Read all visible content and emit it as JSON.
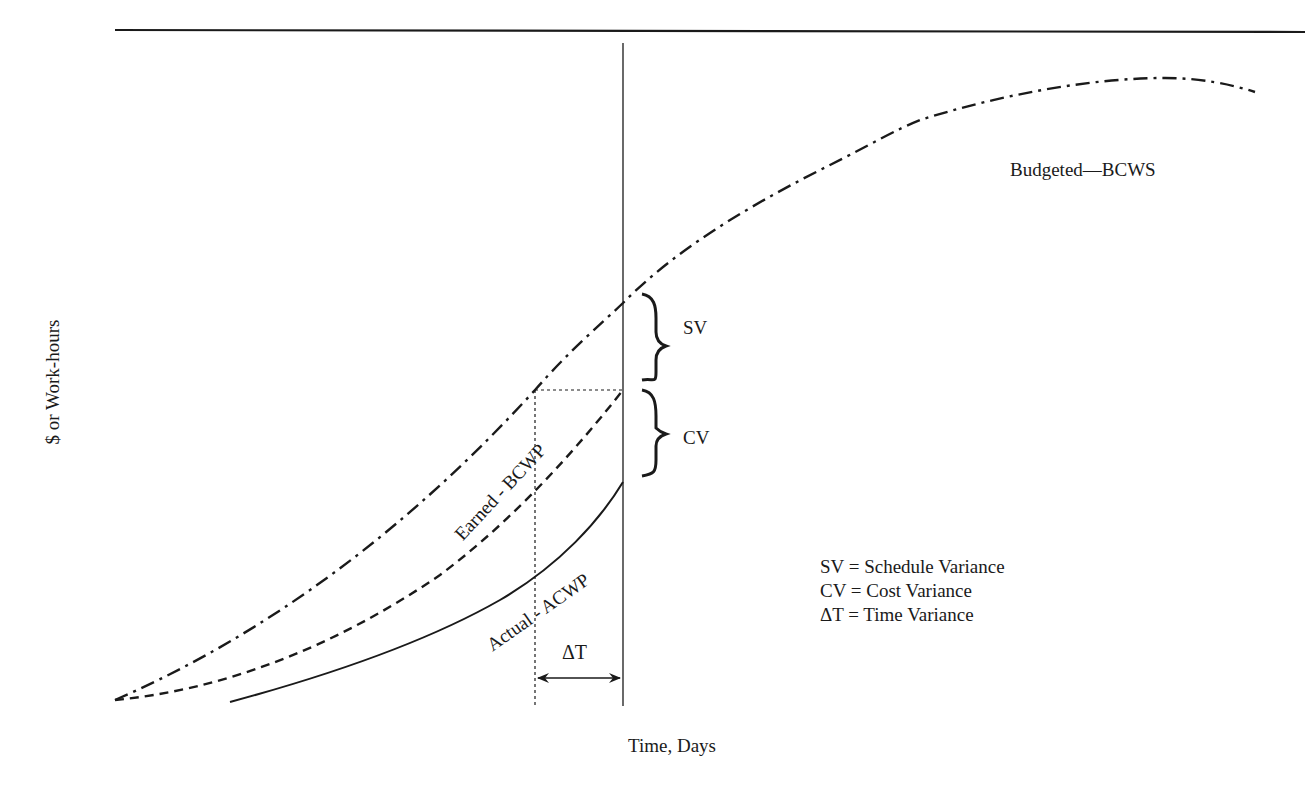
{
  "diagram": {
    "axes": {
      "y_label": "$ or Work-hours",
      "x_label": "Time, Days"
    },
    "curves": [
      {
        "id": "bcws",
        "label": "Budgeted—BCWS",
        "style": "dash-dot"
      },
      {
        "id": "bcwp",
        "label": "Earned - BCWP",
        "style": "dashed"
      },
      {
        "id": "acwp",
        "label": "Actual - ACWP",
        "style": "solid"
      }
    ],
    "annotations": {
      "sv": "SV",
      "cv": "CV",
      "dt": "ΔT"
    },
    "legend": [
      "SV = Schedule Variance",
      "CV = Cost Variance",
      "ΔT = Time Variance"
    ],
    "colors": {
      "ink": "#1a1a1a",
      "background": "#ffffff"
    }
  }
}
